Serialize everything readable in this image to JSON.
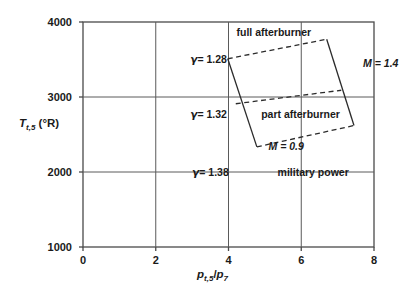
{
  "chart_data": {
    "type": "line",
    "title": "",
    "xlabel": "p_t,5 / p_7",
    "ylabel": "T_t,5 (°R)",
    "xlim": [
      0,
      8
    ],
    "ylim": [
      1000,
      4000
    ],
    "xticks": [
      "0",
      "2",
      "4",
      "6",
      "8"
    ],
    "xtick_values": [
      0,
      2,
      4,
      6,
      8
    ],
    "yticks": [
      "1000",
      "2000",
      "3000",
      "4000"
    ],
    "ytick_values": [
      1000,
      2000,
      3000,
      4000
    ],
    "grid": true,
    "legend": "none",
    "series": [
      {
        "name": "full afterburner",
        "style": "dashed",
        "x": [
          3.98,
          6.7
        ],
        "y": [
          3510,
          3770
        ]
      },
      {
        "name": "part afterburner",
        "style": "dashed",
        "x": [
          4.2,
          7.1
        ],
        "y": [
          2910,
          3090
        ]
      },
      {
        "name": "military power",
        "style": "dashed",
        "x": [
          4.78,
          7.45
        ],
        "y": [
          2335,
          2620
        ]
      },
      {
        "name": "M = 1.4",
        "style": "solid",
        "x": [
          6.7,
          7.45
        ],
        "y": [
          3770,
          2620
        ]
      },
      {
        "name": "M = 0.9",
        "style": "solid",
        "x": [
          3.98,
          4.78
        ],
        "y": [
          3510,
          2335
        ]
      }
    ],
    "annotations": [
      {
        "name": "full-afterburner-label",
        "text": "full afterburner",
        "x": 4.22,
        "y": 3860
      },
      {
        "name": "part-afterburner-label",
        "text": "part afterburner",
        "x": 4.9,
        "y": 2760
      },
      {
        "name": "military-power-label",
        "text": "military power",
        "x": 5.35,
        "y": 1990
      },
      {
        "name": "gamma-128-label",
        "text": "= 1.28",
        "symbol": "γ",
        "x": 2.95,
        "y": 3490
      },
      {
        "name": "gamma-132-label",
        "text": "= 1.32",
        "symbol": "γ",
        "x": 2.95,
        "y": 2760
      },
      {
        "name": "gamma-138-label",
        "text": "= 1.38",
        "symbol": "γ",
        "x": 3.0,
        "y": 1990
      },
      {
        "name": "mach-14-label",
        "text": "M = 1.4",
        "x": 7.7,
        "y": 3440
      },
      {
        "name": "mach-09-label",
        "text": "M = 0.9",
        "x": 5.1,
        "y": 2330
      }
    ]
  },
  "axes": {
    "y_title_main": "T",
    "y_title_sub": "t,5",
    "y_title_unit": "(°R)",
    "x_title_p1": "p",
    "x_title_sub1": "t,5",
    "x_title_slash": "/",
    "x_title_p2": "p",
    "x_title_sub2": "7"
  },
  "colors": {
    "line": "#2b2b2b",
    "grid": "#555555",
    "text": "#1a1a1a",
    "background": "#ffffff"
  }
}
